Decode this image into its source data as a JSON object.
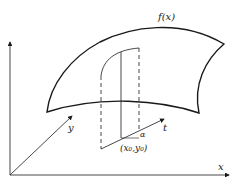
{
  "diagram": {
    "labels": {
      "surface": "f(x)",
      "y_axis": "y",
      "x_axis": "x",
      "t_axis": "t",
      "angle": "α",
      "point": "(x₀,y₀)"
    },
    "colors": {
      "stroke": "#1a1a1a",
      "background": "#ffffff"
    }
  }
}
